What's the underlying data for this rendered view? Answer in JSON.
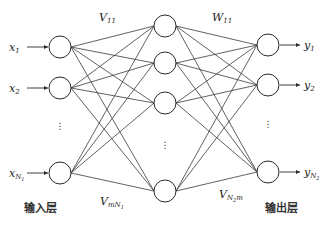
{
  "diagram": {
    "title": "",
    "input_layer": {
      "label": "输入层",
      "nodes": [
        {
          "name": "x",
          "sub": "1",
          "cx": 60,
          "cy": 47
        },
        {
          "name": "x",
          "sub": "2",
          "cx": 60,
          "cy": 88
        },
        {
          "name": "x",
          "sub": "N",
          "subsub": "1",
          "cx": 60,
          "cy": 173
        }
      ],
      "ellipsis_y": 129
    },
    "hidden_layer": {
      "nodes": [
        {
          "cx": 165,
          "cy": 26
        },
        {
          "cx": 165,
          "cy": 63
        },
        {
          "cx": 165,
          "cy": 103
        },
        {
          "cx": 165,
          "cy": 191
        }
      ],
      "ellipsis_y": 148
    },
    "output_layer": {
      "label": "输出层",
      "nodes": [
        {
          "name": "y",
          "sub": "1",
          "cx": 268,
          "cy": 45
        },
        {
          "name": "y",
          "sub": "2",
          "cx": 268,
          "cy": 85
        },
        {
          "name": "y",
          "sub": "N",
          "subsub": "2",
          "cx": 268,
          "cy": 172
        }
      ],
      "ellipsis_y": 127
    },
    "weights": {
      "v_top": {
        "name": "V",
        "sub": "11"
      },
      "w_top": {
        "name": "W",
        "sub": "11"
      },
      "v_bottom": {
        "name": "V",
        "sub": "mN",
        "subsub": "1"
      },
      "w_bottom": {
        "name": "V",
        "sub": "N",
        "subsub": "2",
        "tail": "m"
      }
    },
    "node_radius": 11
  }
}
